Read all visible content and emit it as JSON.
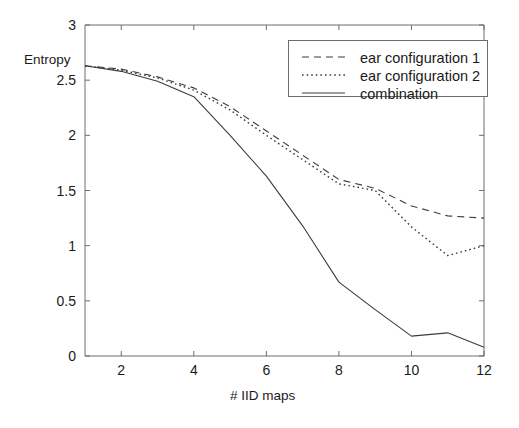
{
  "chart_data": {
    "type": "line",
    "title": "",
    "xlabel": "# IID maps",
    "ylabel": "Entropy",
    "xlim": [
      1,
      12
    ],
    "ylim": [
      0,
      3
    ],
    "grid": false,
    "legend_position": "top-right",
    "x": [
      1,
      2,
      3,
      4,
      5,
      6,
      7,
      8,
      9,
      10,
      11,
      12
    ],
    "xticks": [
      "2",
      "4",
      "6",
      "8",
      "10",
      "12"
    ],
    "xtick_values": [
      2,
      4,
      6,
      8,
      10,
      12
    ],
    "yticks": [
      "0",
      "0.5",
      "1",
      "1.5",
      "2",
      "2.5",
      "3"
    ],
    "ytick_values": [
      0,
      0.5,
      1,
      1.5,
      2,
      2.5,
      3
    ],
    "series": [
      {
        "name": "ear configuration 1",
        "style": "dashed",
        "color": "#3c3c3c",
        "values": [
          2.63,
          2.6,
          2.53,
          2.43,
          2.26,
          2.04,
          1.82,
          1.6,
          1.52,
          1.36,
          1.27,
          1.25
        ]
      },
      {
        "name": "ear configuration 2",
        "style": "dotted",
        "color": "#3c3c3c",
        "values": [
          2.63,
          2.59,
          2.52,
          2.41,
          2.23,
          2.0,
          1.78,
          1.56,
          1.5,
          1.17,
          0.91,
          1.0
        ]
      },
      {
        "name": "combination",
        "style": "solid",
        "color": "#3c3c3c",
        "values": [
          2.63,
          2.58,
          2.49,
          2.35,
          2.0,
          1.63,
          1.18,
          0.67,
          0.42,
          0.18,
          0.21,
          0.08
        ]
      }
    ]
  },
  "legend": {
    "entries": [
      {
        "label": "ear configuration 1",
        "style": "dashed"
      },
      {
        "label": "ear configuration 2",
        "style": "dotted"
      },
      {
        "label": "combination",
        "style": "solid"
      }
    ]
  },
  "axes": {
    "y_label": "Entropy",
    "x_label": "# IID maps"
  }
}
